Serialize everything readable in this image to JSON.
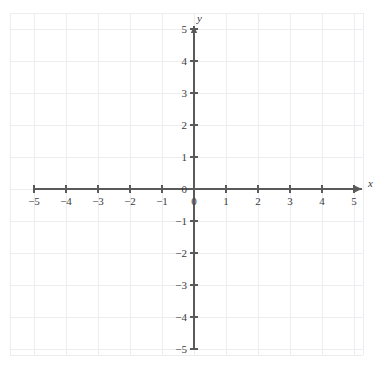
{
  "chart_data": {
    "type": "scatter",
    "title": "",
    "subtitle": "",
    "xlabel": "x",
    "ylabel": "y",
    "xlim": [
      -5,
      5
    ],
    "ylim": [
      -5,
      5
    ],
    "grid": true,
    "grid_spacing": 1,
    "legend": null,
    "series": [],
    "values": [],
    "annotations": [],
    "x_ticks": [
      {
        "value": -5,
        "label": "−5"
      },
      {
        "value": -4,
        "label": "−4"
      },
      {
        "value": -3,
        "label": "−3"
      },
      {
        "value": -2,
        "label": "−2"
      },
      {
        "value": -1,
        "label": "−1"
      },
      {
        "value": 0,
        "label": "0"
      },
      {
        "value": 1,
        "label": "1"
      },
      {
        "value": 2,
        "label": "2"
      },
      {
        "value": 3,
        "label": "3"
      },
      {
        "value": 4,
        "label": "4"
      },
      {
        "value": 5,
        "label": "5"
      }
    ],
    "y_ticks": [
      {
        "value": 5,
        "label": "5"
      },
      {
        "value": 4,
        "label": "4"
      },
      {
        "value": 3,
        "label": "3"
      },
      {
        "value": 2,
        "label": "2"
      },
      {
        "value": 1,
        "label": "1"
      },
      {
        "value": 0,
        "label": "0"
      },
      {
        "value": -1,
        "label": "−1"
      },
      {
        "value": -2,
        "label": "−2"
      },
      {
        "value": -3,
        "label": "−3"
      },
      {
        "value": -4,
        "label": "−4"
      },
      {
        "value": -5,
        "label": "−5"
      }
    ],
    "axis_labels": {
      "x_axis_name": "x",
      "y_axis_name": "y"
    },
    "colors": {
      "background": "#ffffff",
      "grid": "#ededf0",
      "axis": "#5a5a5a",
      "text": "#3b3b3b"
    }
  },
  "geometry": {
    "origin_x": 194,
    "origin_y": 189,
    "unit_px": 32,
    "grid_left": 10,
    "grid_right": 363,
    "grid_top": 13,
    "grid_bottom": 355,
    "x_axis_start": 34,
    "x_axis_end": 362,
    "y_axis_start": 26,
    "y_axis_end": 349,
    "tick_len": 4
  }
}
